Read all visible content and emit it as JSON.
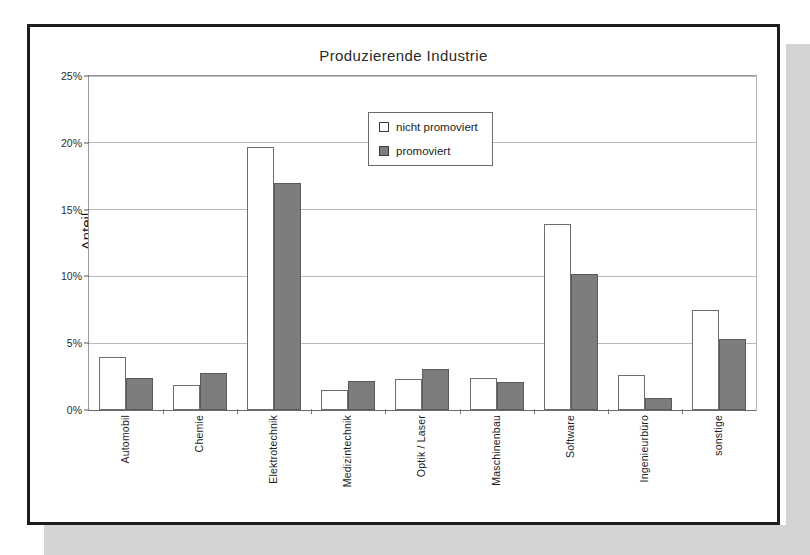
{
  "chart_data": {
    "type": "bar",
    "title": "Produzierende Industrie",
    "xlabel": "",
    "ylabel": "Anteil",
    "ylim": [
      0,
      25
    ],
    "ytick_labels": [
      "0%",
      "5%",
      "10%",
      "15%",
      "20%",
      "25%"
    ],
    "ytick_values": [
      0,
      5,
      10,
      15,
      20,
      25
    ],
    "grid": true,
    "legend_position": "upper center inside plot",
    "categories": [
      "Automobil",
      "Chemie",
      "Elektrotechnik",
      "Medizintechnik",
      "Optik / Laser",
      "Maschinenbau",
      "Software",
      "Ingenieurbüro",
      "sonstige"
    ],
    "series": [
      {
        "name": "nicht promoviert",
        "color": "#ffffff",
        "values": [
          4.0,
          1.9,
          19.7,
          1.5,
          2.3,
          2.4,
          13.9,
          2.6,
          7.5
        ]
      },
      {
        "name": "promoviert",
        "color": "#7d7d7d",
        "values": [
          2.4,
          2.8,
          17.0,
          2.2,
          3.1,
          2.1,
          10.2,
          0.9,
          5.3
        ]
      }
    ]
  },
  "colors": {
    "frame": "#1d1d1d",
    "shadow": "#d4d4d4",
    "gridline": "#b9b9b9",
    "bar_light": "#ffffff",
    "bar_dark": "#7d7d7d",
    "text": "#1d1d1d"
  }
}
